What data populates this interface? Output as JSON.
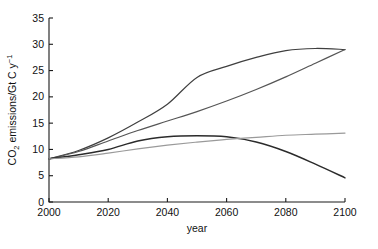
{
  "chart_data": {
    "type": "line",
    "title": "",
    "subtitle": "",
    "xlabel": "year",
    "ylabel": "CO2 emissions/Gt C y-1",
    "ylabel_parts": {
      "pre": "CO",
      "sub": "2",
      "mid": " emissions/Gt C y",
      "sup": "−1"
    },
    "xlim": [
      2000,
      2100
    ],
    "ylim": [
      0,
      35
    ],
    "xticks": [
      2000,
      2020,
      2040,
      2060,
      2080,
      2100
    ],
    "yticks": [
      0,
      5,
      10,
      15,
      20,
      25,
      30,
      35
    ],
    "xtick_labels": [
      "2000",
      "2020",
      "2040",
      "2060",
      "2080",
      "2100"
    ],
    "ytick_labels": [
      "0",
      "5",
      "10",
      "15",
      "20",
      "25",
      "30",
      "35"
    ],
    "grid": false,
    "legend": "none",
    "x": [
      2000,
      2010,
      2020,
      2030,
      2040,
      2050,
      2060,
      2070,
      2080,
      2090,
      2100
    ],
    "series": [
      {
        "name": "A2",
        "color": "#3f3f3f",
        "width": 1.2,
        "values": [
          8.2,
          9.8,
          12.2,
          15.2,
          18.6,
          23.7,
          25.8,
          27.5,
          28.8,
          29.2,
          29.0
        ]
      },
      {
        "name": "A1FI",
        "color": "#555555",
        "width": 1.2,
        "values": [
          8.2,
          9.6,
          11.6,
          13.6,
          15.4,
          17.2,
          19.2,
          21.4,
          23.8,
          26.4,
          29.0
        ]
      },
      {
        "name": "B2",
        "color": "#2b2b2b",
        "width": 1.5,
        "values": [
          8.2,
          9.0,
          10.0,
          11.6,
          12.4,
          12.6,
          12.4,
          11.4,
          9.6,
          7.2,
          4.6
        ]
      },
      {
        "name": "B1",
        "color": "#9a9a9a",
        "width": 1.2,
        "values": [
          8.2,
          8.6,
          9.3,
          10.1,
          10.8,
          11.4,
          11.9,
          12.3,
          12.7,
          12.9,
          13.1
        ]
      }
    ]
  }
}
